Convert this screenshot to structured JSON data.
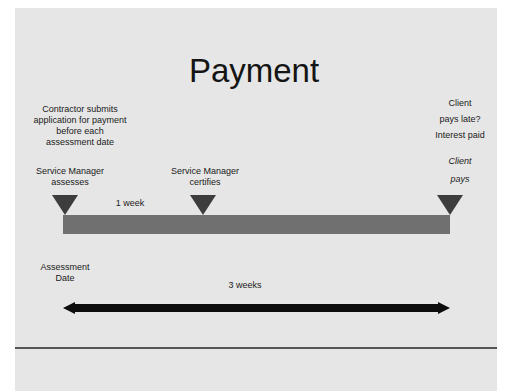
{
  "slide": {
    "title": "Payment",
    "background": "#e6e6e6"
  },
  "labels": {
    "contractor": [
      "Contractor submits",
      "application for payment",
      "before each",
      "assessment date"
    ],
    "sm_assesses": [
      "Service Manager",
      "assesses"
    ],
    "sm_certifies": [
      "Service Manager",
      "certifies"
    ],
    "client_late": [
      "Client",
      "pays late?",
      "Interest paid"
    ],
    "client_pays": [
      "Client",
      "pays"
    ],
    "one_week": "1 week",
    "assessment_date": [
      "Assessment",
      "Date"
    ],
    "three_weeks": "3 weeks"
  },
  "colors": {
    "bar": "#707070",
    "triangle": "#3d3d3d",
    "arrow": "#0d0d0d"
  }
}
